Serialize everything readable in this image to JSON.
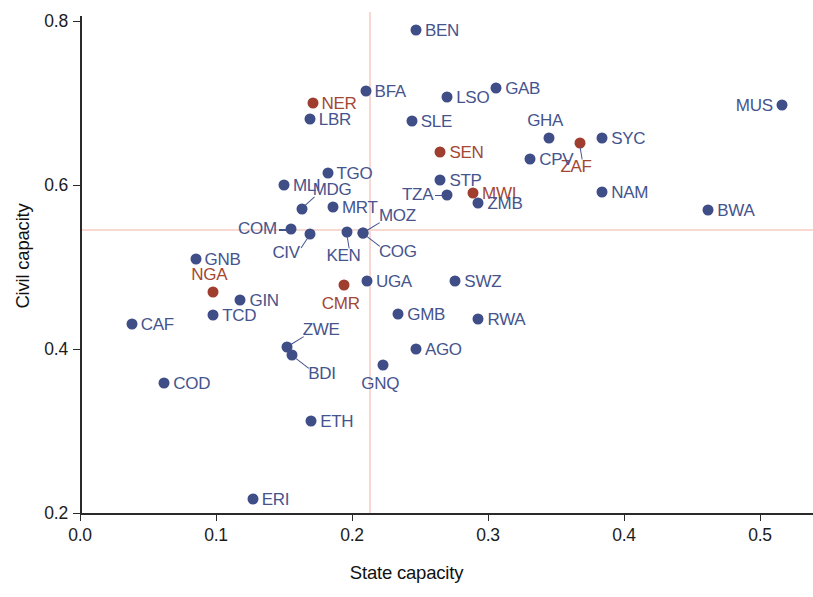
{
  "chart_data": {
    "type": "scatter",
    "title": "",
    "xlabel": "State capacity",
    "ylabel": "Civil capacity",
    "xlim": [
      0.0,
      0.54
    ],
    "ylim": [
      0.2,
      0.81
    ],
    "xticks": [
      "0.0",
      "0.1",
      "0.2",
      "0.3",
      "0.4",
      "0.5"
    ],
    "xtick_values": [
      0.0,
      0.1,
      0.2,
      0.3,
      0.4,
      0.5
    ],
    "yticks": [
      "0.2",
      "0.4",
      "0.6",
      "0.8"
    ],
    "ytick_values": [
      0.2,
      0.4,
      0.6,
      0.8
    ],
    "grid": false,
    "legend": "none",
    "reference_lines": {
      "vertical_x": 0.213,
      "horizontal_y": 0.545,
      "color": "#f8d9d1"
    },
    "colors": {
      "blue": "#3f4e87",
      "red": "#9f3d2e",
      "blue_label": "#45548d",
      "red_label": "#a34733",
      "axis": "#2a2a2a",
      "background": "#ffffff"
    },
    "points": [
      {
        "label": "BEN",
        "x": 0.247,
        "y": 0.789,
        "color": "blue",
        "label_pos": "right"
      },
      {
        "label": "BFA",
        "x": 0.21,
        "y": 0.715,
        "color": "blue",
        "label_pos": "right"
      },
      {
        "label": "LSO",
        "x": 0.27,
        "y": 0.707,
        "color": "blue",
        "label_pos": "right"
      },
      {
        "label": "GAB",
        "x": 0.306,
        "y": 0.718,
        "color": "blue",
        "label_pos": "right"
      },
      {
        "label": "MUS",
        "x": 0.516,
        "y": 0.698,
        "color": "blue",
        "label_pos": "left"
      },
      {
        "label": "NER",
        "x": 0.171,
        "y": 0.7,
        "color": "red",
        "label_pos": "right"
      },
      {
        "label": "LBR",
        "x": 0.169,
        "y": 0.68,
        "color": "blue",
        "label_pos": "right"
      },
      {
        "label": "SLE",
        "x": 0.244,
        "y": 0.678,
        "color": "blue",
        "label_pos": "right"
      },
      {
        "label": "GHA",
        "x": 0.345,
        "y": 0.657,
        "color": "blue",
        "label_pos": "above"
      },
      {
        "label": "SYC",
        "x": 0.384,
        "y": 0.657,
        "color": "blue",
        "label_pos": "right"
      },
      {
        "label": "ZAF",
        "x": 0.368,
        "y": 0.651,
        "color": "red",
        "label_pos": "below-leader"
      },
      {
        "label": "SEN",
        "x": 0.265,
        "y": 0.64,
        "color": "red",
        "label_pos": "right"
      },
      {
        "label": "CPV",
        "x": 0.331,
        "y": 0.632,
        "color": "blue",
        "label_pos": "right"
      },
      {
        "label": "TGO",
        "x": 0.182,
        "y": 0.615,
        "color": "blue",
        "label_pos": "right"
      },
      {
        "label": "MLI",
        "x": 0.15,
        "y": 0.6,
        "color": "blue",
        "label_pos": "right"
      },
      {
        "label": "STP",
        "x": 0.265,
        "y": 0.606,
        "color": "blue",
        "label_pos": "right"
      },
      {
        "label": "NAM",
        "x": 0.384,
        "y": 0.592,
        "color": "blue",
        "label_pos": "right"
      },
      {
        "label": "MDG",
        "x": 0.163,
        "y": 0.571,
        "color": "blue",
        "label_pos": "above-leader"
      },
      {
        "label": "TZA",
        "x": 0.27,
        "y": 0.588,
        "color": "blue",
        "label_pos": "left-leader"
      },
      {
        "label": "MWI",
        "x": 0.289,
        "y": 0.59,
        "color": "red",
        "label_pos": "right"
      },
      {
        "label": "MRT",
        "x": 0.186,
        "y": 0.573,
        "color": "blue",
        "label_pos": "right"
      },
      {
        "label": "ZMB",
        "x": 0.293,
        "y": 0.578,
        "color": "blue",
        "label_pos": "right"
      },
      {
        "label": "COM",
        "x": 0.155,
        "y": 0.546,
        "color": "blue",
        "label_pos": "left-leader"
      },
      {
        "label": "CIV",
        "x": 0.169,
        "y": 0.54,
        "color": "blue",
        "label_pos": "below-left-leader"
      },
      {
        "label": "KEN",
        "x": 0.196,
        "y": 0.543,
        "color": "blue",
        "label_pos": "below-leader"
      },
      {
        "label": "MOZ",
        "x": 0.208,
        "y": 0.541,
        "color": "blue",
        "label_pos": "above-right-leader"
      },
      {
        "label": "COG",
        "x": 0.208,
        "y": 0.541,
        "color": "blue",
        "label_pos": "below-right-leader"
      },
      {
        "label": "BWA",
        "x": 0.462,
        "y": 0.57,
        "color": "blue",
        "label_pos": "right"
      },
      {
        "label": "GNB",
        "x": 0.085,
        "y": 0.51,
        "color": "blue",
        "label_pos": "right"
      },
      {
        "label": "NGA",
        "x": 0.098,
        "y": 0.47,
        "color": "red",
        "label_pos": "above"
      },
      {
        "label": "GIN",
        "x": 0.118,
        "y": 0.46,
        "color": "blue",
        "label_pos": "right"
      },
      {
        "label": "TCD",
        "x": 0.098,
        "y": 0.441,
        "color": "blue",
        "label_pos": "right"
      },
      {
        "label": "CAF",
        "x": 0.038,
        "y": 0.431,
        "color": "blue",
        "label_pos": "right"
      },
      {
        "label": "UGA",
        "x": 0.211,
        "y": 0.483,
        "color": "blue",
        "label_pos": "right"
      },
      {
        "label": "CMR",
        "x": 0.194,
        "y": 0.478,
        "color": "red",
        "label_pos": "below"
      },
      {
        "label": "SWZ",
        "x": 0.276,
        "y": 0.483,
        "color": "blue",
        "label_pos": "right"
      },
      {
        "label": "GMB",
        "x": 0.234,
        "y": 0.443,
        "color": "blue",
        "label_pos": "right"
      },
      {
        "label": "RWA",
        "x": 0.293,
        "y": 0.437,
        "color": "blue",
        "label_pos": "right"
      },
      {
        "label": "ZWE",
        "x": 0.152,
        "y": 0.403,
        "color": "blue",
        "label_pos": "above-right-leader"
      },
      {
        "label": "BDI",
        "x": 0.156,
        "y": 0.393,
        "color": "blue",
        "label_pos": "below-right-leader"
      },
      {
        "label": "AGO",
        "x": 0.247,
        "y": 0.4,
        "color": "blue",
        "label_pos": "right"
      },
      {
        "label": "GNQ",
        "x": 0.223,
        "y": 0.381,
        "color": "blue",
        "label_pos": "below"
      },
      {
        "label": "COD",
        "x": 0.062,
        "y": 0.358,
        "color": "blue",
        "label_pos": "right"
      },
      {
        "label": "ETH",
        "x": 0.17,
        "y": 0.312,
        "color": "blue",
        "label_pos": "right"
      },
      {
        "label": "ERI",
        "x": 0.127,
        "y": 0.217,
        "color": "blue",
        "label_pos": "right"
      }
    ]
  }
}
